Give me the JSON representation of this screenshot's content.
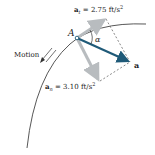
{
  "diagram": {
    "point_label": "A",
    "angle_label": "α",
    "motion_label": "Motion",
    "a_t": {
      "symbol": "a",
      "subscript": "t",
      "value_text": " = 2.75 ft/s",
      "exp": "2"
    },
    "a_n": {
      "symbol": "a",
      "subscript": "n",
      "value_text": " = 3.10 ft/s",
      "exp": "2"
    },
    "a_total_label": "a",
    "colors": {
      "path": "#444444",
      "component_vector": "#b8bcbf",
      "resultant_vector": "#1f5a78",
      "dashed": "#555555"
    }
  }
}
